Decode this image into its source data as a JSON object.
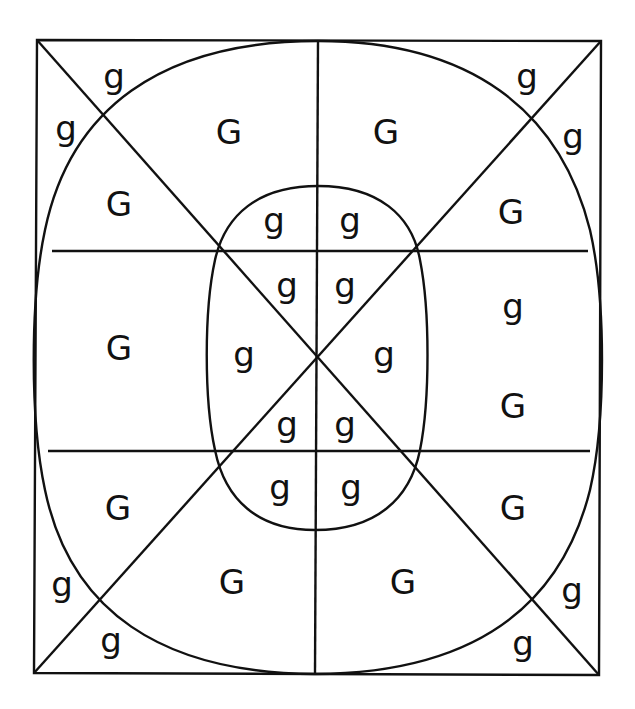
{
  "diagram": {
    "background": "#ffffff",
    "line_color": "#111111",
    "font_size": 34,
    "frame": {
      "tl": [
        37,
        40
      ],
      "tr": [
        601,
        41
      ],
      "br": [
        599,
        675
      ],
      "bl": [
        34,
        673
      ]
    },
    "center": [
      316,
      356
    ],
    "vertical_line": {
      "x_top": 318,
      "y_top": 41,
      "x_bottom": 315,
      "y_bottom": 674
    },
    "horizontal_lines": [
      {
        "x1": 52,
        "x2": 588,
        "y": 251
      },
      {
        "x1": 48,
        "x2": 590,
        "y": 451
      }
    ],
    "outer_shape": {
      "path": "M 318 41 C 470 41 560 110 590 230 C 606 300 606 420 590 490 C 560 610 470 673 315 674 C 160 673 70 610 45 490 C 30 420 30 300 45 230 C 70 110 160 41 318 41 Z"
    },
    "inner_shape": {
      "path": "M 318 186 C 378 186 412 215 420 260 C 430 310 430 400 420 450 C 410 500 375 530 315 530 C 258 530 225 500 215 450 C 204 400 204 310 215 260 C 225 215 258 186 318 186 Z"
    },
    "labels": [
      {
        "text": "g",
        "x": 114,
        "y": 88
      },
      {
        "text": "g",
        "x": 66,
        "y": 140
      },
      {
        "text": "G",
        "x": 229,
        "y": 144
      },
      {
        "text": "G",
        "x": 386,
        "y": 144
      },
      {
        "text": "g",
        "x": 527,
        "y": 88
      },
      {
        "text": "g",
        "x": 573,
        "y": 148
      },
      {
        "text": "G",
        "x": 119,
        "y": 216
      },
      {
        "text": "g",
        "x": 274,
        "y": 232
      },
      {
        "text": "g",
        "x": 350,
        "y": 232
      },
      {
        "text": "G",
        "x": 511,
        "y": 224
      },
      {
        "text": "g",
        "x": 287,
        "y": 297
      },
      {
        "text": "g",
        "x": 345,
        "y": 297
      },
      {
        "text": "g",
        "x": 513,
        "y": 318
      },
      {
        "text": "G",
        "x": 119,
        "y": 360
      },
      {
        "text": "g",
        "x": 244,
        "y": 366
      },
      {
        "text": "g",
        "x": 384,
        "y": 366
      },
      {
        "text": "G",
        "x": 513,
        "y": 418
      },
      {
        "text": "g",
        "x": 287,
        "y": 436
      },
      {
        "text": "g",
        "x": 345,
        "y": 436
      },
      {
        "text": "g",
        "x": 280,
        "y": 499
      },
      {
        "text": "g",
        "x": 351,
        "y": 499
      },
      {
        "text": "G",
        "x": 118,
        "y": 520
      },
      {
        "text": "G",
        "x": 513,
        "y": 520
      },
      {
        "text": "G",
        "x": 232,
        "y": 594
      },
      {
        "text": "G",
        "x": 403,
        "y": 594
      },
      {
        "text": "g",
        "x": 62,
        "y": 596
      },
      {
        "text": "g",
        "x": 572,
        "y": 602
      },
      {
        "text": "g",
        "x": 111,
        "y": 652
      },
      {
        "text": "g",
        "x": 523,
        "y": 655
      }
    ]
  }
}
